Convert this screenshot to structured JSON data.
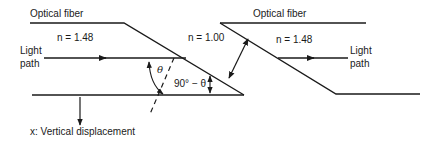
{
  "diagram": {
    "left_fiber": {
      "label": "Optical fiber",
      "index_label": "n = 1.48",
      "light_path_line1": "Light",
      "light_path_line2": "path"
    },
    "gap": {
      "index_label": "n = 1.00"
    },
    "right_fiber": {
      "label": "Optical fiber",
      "index_label": "n = 1.48",
      "light_path_line1": "Light",
      "light_path_line2": "path"
    },
    "angles": {
      "theta": "θ",
      "complement": "90° − θ"
    },
    "displacement_label": "x:  Vertical displacement",
    "colors": {
      "line": "#1a1a1a",
      "background": "#ffffff"
    }
  }
}
